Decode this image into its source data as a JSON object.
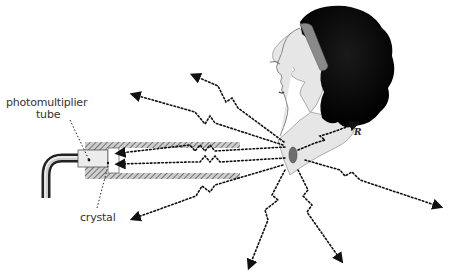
{
  "diagram": {
    "labels": {
      "photomultiplier_line1": "photomultiplier",
      "photomultiplier_line2": "tube",
      "crystal": "crystal",
      "artist_signature": "R"
    },
    "components": [
      "photomultiplier tube",
      "crystal",
      "lead collimator",
      "cable",
      "patient head",
      "thyroid gland"
    ],
    "radiation_rays": 8,
    "colors": {
      "background": "#ffffff",
      "hair": "#111111",
      "skin": "#e6e6e6",
      "headband": "#8a8a8a",
      "collimator": "#7a7a7a",
      "thyroid": "#6e6e6e",
      "rays": "#111111",
      "text": "#333333"
    }
  }
}
